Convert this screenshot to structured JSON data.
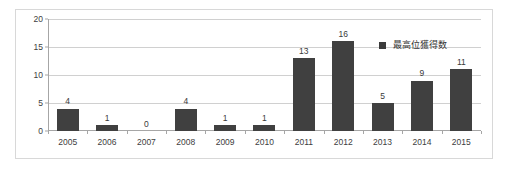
{
  "chart_data": {
    "type": "bar",
    "title": "",
    "xlabel": "",
    "ylabel": "",
    "categories": [
      "2005",
      "2006",
      "2007",
      "2008",
      "2009",
      "2010",
      "2011",
      "2012",
      "2013",
      "2014",
      "2015"
    ],
    "values": [
      4,
      1,
      0,
      4,
      1,
      1,
      13,
      16,
      5,
      9,
      11
    ],
    "series": [
      {
        "name": "最高位獲得数",
        "values": [
          4,
          1,
          0,
          4,
          1,
          1,
          13,
          16,
          5,
          9,
          11
        ],
        "color": "#404040"
      }
    ],
    "ylim": [
      0,
      20
    ],
    "yticks": [
      0,
      5,
      10,
      15,
      20
    ],
    "ytick_labels": [
      "0",
      "5",
      "10",
      "15",
      "20"
    ],
    "grid": true,
    "legend_position": "top-right",
    "data_labels": true
  },
  "legend": {
    "label": "最高位獲得数",
    "marker_color": "#3b3b3b"
  },
  "style": {
    "bar_color": "#404040",
    "grid_color": "#d0d0d0",
    "axis_color": "#a6a6a6",
    "frame_border": "#d8d8d8",
    "background": "#ffffff",
    "text_color": "#404040"
  }
}
